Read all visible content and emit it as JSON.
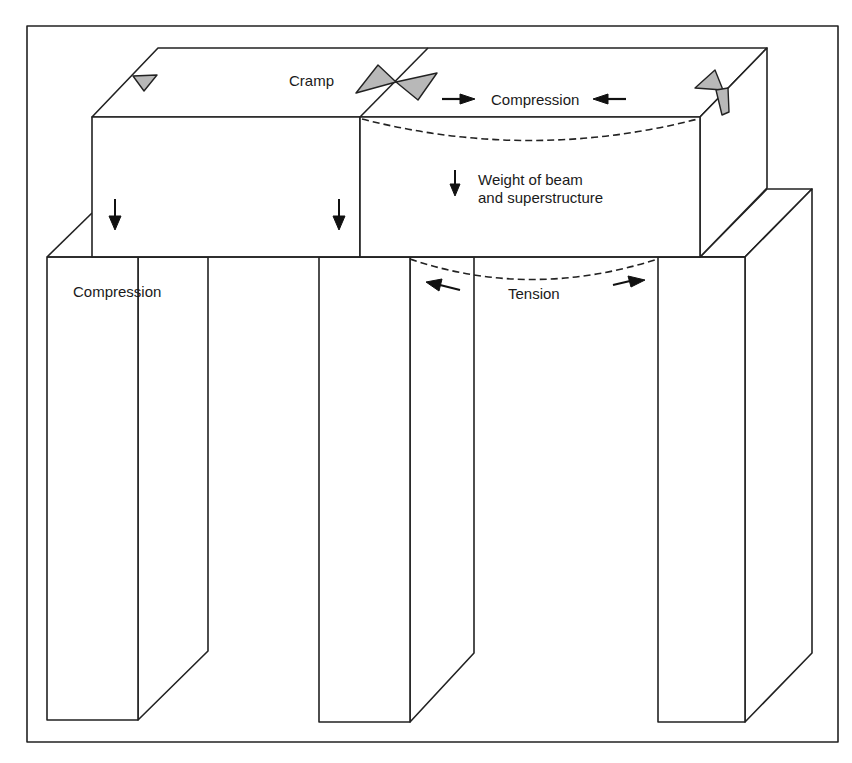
{
  "figure": {
    "labels": {
      "cramp": "Cramp",
      "beam_compression": "Compression",
      "weight_line1": "Weight of beam",
      "weight_line2": "and superstructure",
      "pillar_compression": "Compression",
      "tension": "Tension"
    },
    "colors": {
      "line": "#222222",
      "cramp_fill": "#b8b8b8",
      "background": "#ffffff"
    },
    "elements": {
      "pillars": 3,
      "lintels": 2,
      "cramps": 3
    }
  }
}
